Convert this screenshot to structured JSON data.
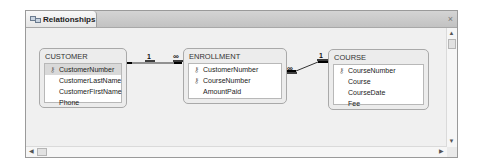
{
  "window": {
    "tab_title": "Relationships",
    "tab_icon": "relationships-icon",
    "close_label": "×"
  },
  "tables": [
    {
      "name": "CUSTOMER",
      "fields": [
        {
          "name": "CustomerNumber",
          "key": true,
          "selected": true
        },
        {
          "name": "CustomerLastName",
          "key": false
        },
        {
          "name": "CustomerFirstName",
          "key": false
        },
        {
          "name": "Phone",
          "key": false
        }
      ]
    },
    {
      "name": "ENROLLMENT",
      "fields": [
        {
          "name": "CustomerNumber",
          "key": true
        },
        {
          "name": "CourseNumber",
          "key": true
        },
        {
          "name": "AmountPaid",
          "key": false
        }
      ]
    },
    {
      "name": "COURSE",
      "fields": [
        {
          "name": "CourseNumber",
          "key": true
        },
        {
          "name": "Course",
          "key": false
        },
        {
          "name": "CourseDate",
          "key": false
        },
        {
          "name": "Fee",
          "key": false
        }
      ]
    }
  ],
  "relationships": [
    {
      "from": "CUSTOMER.CustomerNumber",
      "to": "ENROLLMENT.CustomerNumber",
      "from_label": "1",
      "to_label": "∞"
    },
    {
      "from": "COURSE.CourseNumber",
      "to": "ENROLLMENT.CourseNumber",
      "from_label": "1",
      "to_label": "∞"
    }
  ],
  "key_glyph": "⚷",
  "scrollbar": {
    "up": "▲",
    "down": "▼",
    "left": "◀",
    "right": "▶"
  }
}
